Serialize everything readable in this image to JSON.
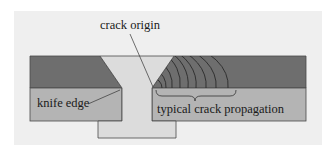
{
  "diagram": {
    "type": "weld cross-section",
    "labels": {
      "crack_origin": "crack origin",
      "knife_edge": "knife edge",
      "typical_crack_propagation": "typical crack propagation"
    },
    "colors": {
      "page_bg": "#ffffff",
      "panel_bg": "#efefef",
      "upper_plate": "#6e6e6e",
      "lower_plate": "#b4b4b4",
      "weld": "#dcdcdc",
      "outline": "#4a4a4a",
      "crack_lines": "#2a2a2a",
      "text": "#1a1a1a"
    }
  }
}
